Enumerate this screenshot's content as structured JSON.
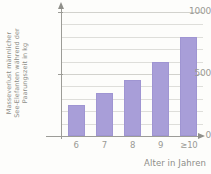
{
  "chart_data": {
    "type": "bar",
    "title": "",
    "subtitle": "",
    "categories": [
      "6",
      "7",
      "8",
      "9",
      "≥10"
    ],
    "values": [
      250,
      350,
      450,
      600,
      800
    ],
    "series": [
      {
        "name": "Masseverlust",
        "values": [
          250,
          350,
          450,
          600,
          800
        ]
      }
    ],
    "xlabel": "Alter in Jahren",
    "ylabel": "Masseverlust männlicher See-Elefanten während der Paarungszeit in kg",
    "ylabel_lines": [
      "Masseverlust männlicher",
      "See-Elefanten während der",
      "Paarungszeit in kg"
    ],
    "ylim": [
      0,
      1000
    ],
    "xlim_categories": 5,
    "ytick_labels": [
      "0",
      "500",
      "1000"
    ],
    "ytick_values": [
      0,
      500,
      1000
    ],
    "gridlines_minor_step": 100,
    "gridlines_values": [
      100,
      200,
      300,
      400,
      500,
      600,
      700,
      800,
      900,
      1000
    ],
    "grid": true,
    "legend": false,
    "legend_position": "none",
    "bar_color": "#a89ed8",
    "bar_border_color": "#9f95d2",
    "grid_color": "#dedeca",
    "axis_color": "#9c9c97",
    "text_color": "#9a9a95",
    "background_color": "#fdfdfb"
  },
  "axes": {
    "y_arrow": "arrow-up-icon",
    "x_arrow": "arrow-right-icon"
  }
}
